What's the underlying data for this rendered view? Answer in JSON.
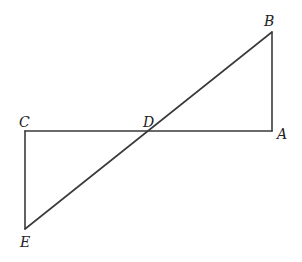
{
  "diagram": {
    "title": "",
    "points": {
      "A": {
        "label": "A",
        "x": 272,
        "y": 131
      },
      "B": {
        "label": "B",
        "x": 272,
        "y": 32
      },
      "C": {
        "label": "C",
        "x": 25,
        "y": 131
      },
      "D": {
        "label": "D",
        "x": 148,
        "y": 131
      },
      "E": {
        "label": "E",
        "x": 25,
        "y": 229
      }
    },
    "segments": [
      "CA",
      "AB",
      "BE",
      "CE"
    ],
    "labels": {
      "A": "A",
      "B": "B",
      "C": "C",
      "D": "D",
      "E": "E"
    },
    "stroke_color": "#3a3a3a"
  }
}
